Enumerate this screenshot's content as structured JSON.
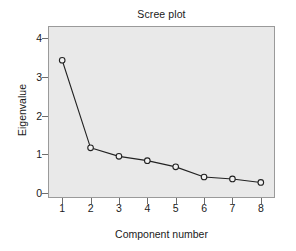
{
  "chart_data": {
    "type": "line",
    "title": "Scree plot",
    "xlabel": "Component number",
    "ylabel": "Eigenvalue",
    "x": [
      1,
      2,
      3,
      4,
      5,
      6,
      7,
      8
    ],
    "categories": [
      "1",
      "2",
      "3",
      "4",
      "5",
      "6",
      "7",
      "8"
    ],
    "values": [
      3.42,
      1.17,
      0.95,
      0.84,
      0.68,
      0.42,
      0.37,
      0.28
    ],
    "series": [
      {
        "name": "Eigenvalue",
        "values": [
          3.42,
          1.17,
          0.95,
          0.84,
          0.68,
          0.42,
          0.37,
          0.28
        ]
      }
    ],
    "xlim": [
      0.5,
      8.5
    ],
    "ylim": [
      -0.12,
      4.3
    ],
    "xticks": [
      "1",
      "2",
      "3",
      "4",
      "5",
      "6",
      "7",
      "8"
    ],
    "yticks": [
      "0",
      "1",
      "2",
      "3",
      "4"
    ],
    "ytick_values": [
      0,
      1,
      2,
      3,
      4
    ],
    "grid": false,
    "legend": "none",
    "marker": "open-circle",
    "line_color": "#222222",
    "marker_fill": "#f2f2f2",
    "plot_background": "#e9e9e9",
    "figure_background": "#ffffff",
    "border_color": "#9a9a9a"
  }
}
